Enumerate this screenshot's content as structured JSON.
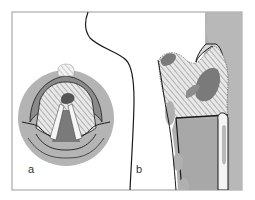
{
  "figure": {
    "panel_a_label": "a",
    "panel_b_label": "b",
    "colors": {
      "background": "#ffffff",
      "frame": "#9a9a9a",
      "tissue_light": "#c4c4c4",
      "tissue_mid": "#a8a8a8",
      "tissue_dark": "#7a7a7a",
      "outline": "#1a1a1a",
      "hatch": "#888888"
    }
  }
}
